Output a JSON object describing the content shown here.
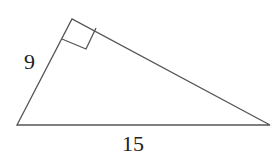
{
  "diagram": {
    "type": "right-triangle",
    "vertices": {
      "bottom_left": [
        17,
        125
      ],
      "top": [
        72,
        19
      ],
      "bottom_right": [
        270,
        125
      ]
    },
    "right_angle_at": "top",
    "labels": {
      "left_leg": "9",
      "base": "15"
    },
    "stroke_color": "#555555"
  }
}
